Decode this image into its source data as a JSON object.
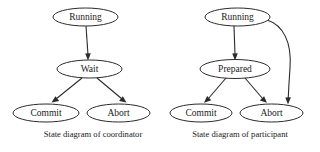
{
  "figure": {
    "background_color": "#ffffff",
    "stroke_color": "#2b2b2b",
    "text_color": "#1a1a1a"
  },
  "diagrams": [
    {
      "id": "coordinator",
      "caption": "State diagram of coordinator",
      "nodes": [
        {
          "id": "running",
          "label": "Running",
          "cx": 85.5,
          "cy": 17,
          "rx": 32.5,
          "ry": 9
        },
        {
          "id": "wait",
          "label": "Wait",
          "cx": 89.5,
          "cy": 69,
          "rx": 32.5,
          "ry": 9
        },
        {
          "id": "commit",
          "label": "Commit",
          "cx": 46,
          "cy": 113,
          "rx": 33,
          "ry": 9
        },
        {
          "id": "abort",
          "label": "Abort",
          "cx": 118.5,
          "cy": 113,
          "rx": 31.5,
          "ry": 9
        }
      ],
      "edges": [
        {
          "id": "running-to-wait",
          "from": "running",
          "to": "wait",
          "kind": "straight"
        },
        {
          "id": "wait-to-commit",
          "from": "wait",
          "to": "commit",
          "kind": "straight"
        },
        {
          "id": "wait-to-abort",
          "from": "wait",
          "to": "abort",
          "kind": "straight"
        }
      ]
    },
    {
      "id": "participant",
      "caption": "State diagram of participant",
      "nodes": [
        {
          "id": "running",
          "label": "Running",
          "cx": 237.5,
          "cy": 17,
          "rx": 32.5,
          "ry": 9
        },
        {
          "id": "prepared",
          "label": "Prepared",
          "cx": 235,
          "cy": 69,
          "rx": 35,
          "ry": 9.5
        },
        {
          "id": "commit",
          "label": "Commit",
          "cx": 201,
          "cy": 113,
          "rx": 31,
          "ry": 9
        },
        {
          "id": "abort",
          "label": "Abort",
          "cx": 271.5,
          "cy": 113,
          "rx": 31.5,
          "ry": 9
        }
      ],
      "edges": [
        {
          "id": "running-to-prepared",
          "from": "running",
          "to": "prepared",
          "kind": "straight"
        },
        {
          "id": "prepared-to-commit",
          "from": "prepared",
          "to": "commit",
          "kind": "straight"
        },
        {
          "id": "prepared-to-abort",
          "from": "prepared",
          "to": "abort",
          "kind": "straight"
        },
        {
          "id": "running-to-abort",
          "from": "running",
          "to": "abort",
          "kind": "curved"
        }
      ]
    }
  ],
  "captions": {
    "left": "State diagram of coordinator",
    "right": "State diagram of participant"
  }
}
